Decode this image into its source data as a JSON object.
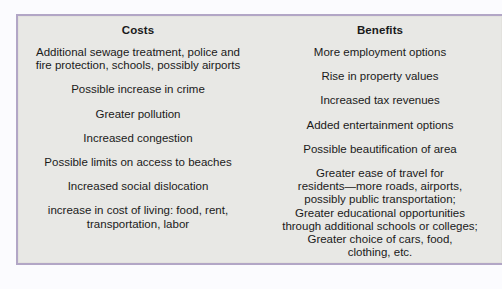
{
  "colors": {
    "page_background": "#fbfbfe",
    "panel_background": "#e8e8e5",
    "panel_border": "#b2a6c6",
    "text": "#1a1a1a"
  },
  "table": {
    "columns": [
      {
        "heading": "Costs",
        "items": [
          "Additional sewage treatment, police and\nfire protection, schools, possibly airports",
          "Possible increase in crime",
          "Greater pollution",
          "Increased congestion",
          "Possible limits on access to beaches",
          "Increased social dislocation",
          "increase in cost of living: food, rent,\ntransportation, labor"
        ]
      },
      {
        "heading": "Benefits",
        "items": [
          "More employment options",
          "Rise in property values",
          "Increased tax revenues",
          "Added entertainment options",
          "Possible beautification of area",
          "Greater ease of travel for\nresidents—more roads, airports,\npossibly public transportation;\nGreater educational opportunities\nthrough additional schools or colleges;\nGreater choice of cars, food,\nclothing, etc."
        ]
      }
    ]
  }
}
